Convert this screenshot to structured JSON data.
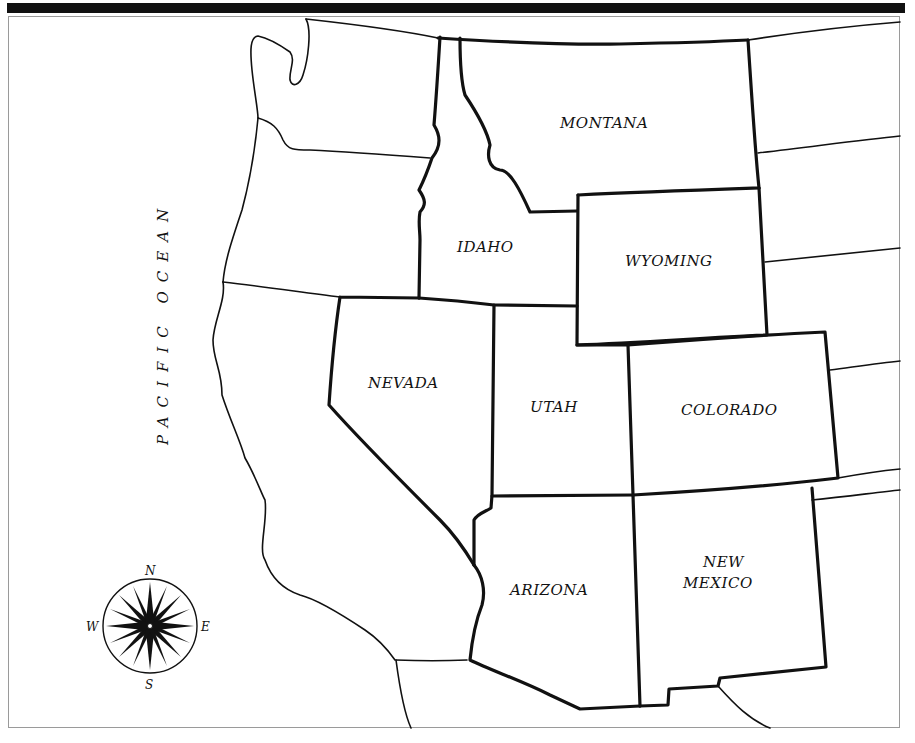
{
  "map": {
    "title": "Western United States outline map",
    "ocean_label": "PACIFIC OCEAN",
    "states": [
      {
        "name": "MONTANA"
      },
      {
        "name": "IDAHO"
      },
      {
        "name": "WYOMING"
      },
      {
        "name": "NEVADA"
      },
      {
        "name": "UTAH"
      },
      {
        "name": "COLORADO"
      },
      {
        "name": "ARIZONA"
      },
      {
        "name": "NEW",
        "line2": "MEXICO"
      }
    ],
    "compass": {
      "north": "N",
      "south": "S",
      "east": "E",
      "west": "W"
    },
    "colors": {
      "ink": "#111111",
      "paper": "#ffffff",
      "frame": "#9a9a9a"
    }
  }
}
